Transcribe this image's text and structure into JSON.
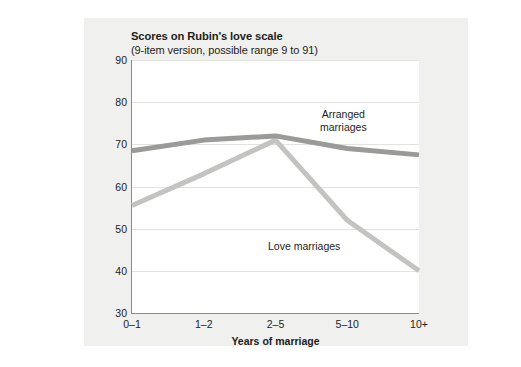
{
  "figure": {
    "title": "Scores on Rubin's love scale",
    "subtitle": "(9-item version, possible range 9 to 91)"
  },
  "chart_data": {
    "type": "line",
    "title": "Scores on Rubin's love scale",
    "subtitle": "(9-item version, possible range 9 to 91)",
    "xlabel": "Years of marriage",
    "ylabel": "",
    "categories": [
      "0–1",
      "1–2",
      "2–5",
      "5–10",
      "10+"
    ],
    "ylim": [
      30,
      90
    ],
    "yticks": [
      30,
      40,
      50,
      60,
      70,
      80,
      90
    ],
    "grid": true,
    "legend": "inline-annotations",
    "series": [
      {
        "name": "Arranged marriages",
        "label": "Arranged\nmarriages",
        "label_line1": "Arranged",
        "label_line2": "marriages",
        "color": "#9a9a98",
        "values": [
          68.5,
          71,
          72,
          69,
          67.5
        ]
      },
      {
        "name": "Love marriages",
        "label": "Love marriages",
        "color": "#c3c3c1",
        "values": [
          55.5,
          63,
          71,
          52,
          40
        ]
      }
    ]
  },
  "colors": {
    "panel_background": "#f0f0ee",
    "plot_background": "#ffffff",
    "axis": "#8a8a88",
    "gridline": "#e2e2e0",
    "text": "#1d1d1b",
    "arranged_line": "#9a9a98",
    "love_line": "#c3c3c1"
  }
}
